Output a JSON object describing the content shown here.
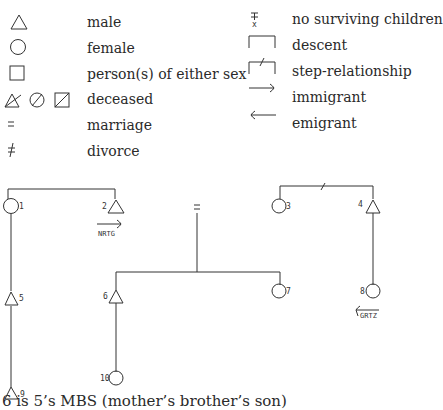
{
  "legend": {
    "left": [
      {
        "symbol": "triangle-male-icon",
        "label": "male"
      },
      {
        "symbol": "circle-female-icon",
        "label": "female"
      },
      {
        "symbol": "square-either-sex-icon",
        "label": "person(s) of either sex"
      },
      {
        "symbol": "deceased-icons",
        "label": "deceased"
      },
      {
        "symbol": "marriage-icon",
        "label": "marriage"
      },
      {
        "symbol": "divorce-icon",
        "label": "divorce"
      }
    ],
    "right": [
      {
        "symbol": "no-surviving-children-icon",
        "label": "no surviving children"
      },
      {
        "symbol": "descent-icon",
        "label": "descent"
      },
      {
        "symbol": "step-relationship-icon",
        "label": "step-relationship"
      },
      {
        "symbol": "immigrant-arrow-icon",
        "label": "immigrant"
      },
      {
        "symbol": "emigrant-arrow-icon",
        "label": "emigrant"
      }
    ],
    "no_children_mark": "x"
  },
  "diagram": {
    "persons": [
      {
        "id": "1",
        "sex": "female"
      },
      {
        "id": "2",
        "sex": "male"
      },
      {
        "id": "3",
        "sex": "female"
      },
      {
        "id": "4",
        "sex": "male"
      },
      {
        "id": "5",
        "sex": "male"
      },
      {
        "id": "6",
        "sex": "male"
      },
      {
        "id": "7",
        "sex": "female"
      },
      {
        "id": "8",
        "sex": "female"
      },
      {
        "id": "9",
        "sex": "male"
      },
      {
        "id": "10",
        "sex": "female"
      }
    ],
    "migration_tags": {
      "immigrant": "NRTG",
      "emigrant": "GRTZ"
    }
  },
  "caption": "6   is 5’s MBS (mother’s brother’s son)"
}
